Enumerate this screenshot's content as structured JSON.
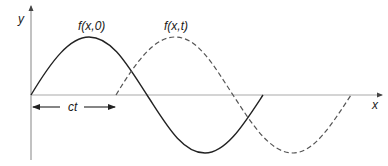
{
  "diagram": {
    "type": "traveling-wave",
    "axes": {
      "x_label": "x",
      "y_label": "y"
    },
    "curves": [
      {
        "name": "f(x,0)",
        "label": "f(x,0)",
        "style": "solid",
        "color": "#222222"
      },
      {
        "name": "f(x,t)",
        "label": "f(x,t)",
        "style": "dashed",
        "color": "#555555"
      }
    ],
    "displacement": {
      "label": "ct"
    }
  }
}
